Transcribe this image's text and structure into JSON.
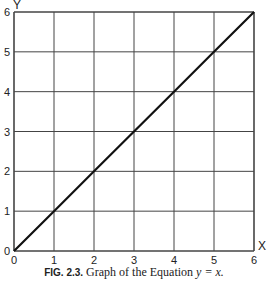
{
  "chart_data": {
    "type": "line",
    "title": "Graph of the Equation y = x.",
    "caption_label": "FIG. 2.3.",
    "caption_text": "Graph of the Equation",
    "caption_equation": "y = x.",
    "xlabel": "X",
    "ylabel": "Y",
    "xlim": [
      0,
      6
    ],
    "ylim": [
      0,
      6
    ],
    "x_ticks": [
      "0",
      "1",
      "2",
      "3",
      "4",
      "5",
      "6"
    ],
    "y_ticks": [
      "0",
      "1",
      "2",
      "3",
      "4",
      "5",
      "6"
    ],
    "grid": true,
    "series": [
      {
        "name": "y = x",
        "x": [
          0,
          1,
          2,
          3,
          4,
          5,
          6
        ],
        "y": [
          0,
          1,
          2,
          3,
          4,
          5,
          6
        ]
      }
    ]
  }
}
